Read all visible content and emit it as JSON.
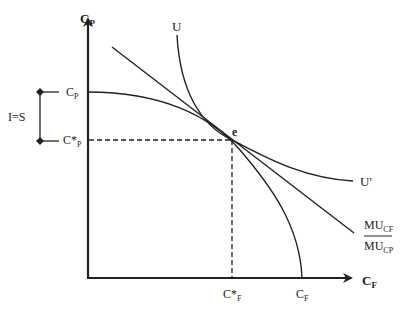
{
  "diagram": {
    "type": "intertemporal-consumption-ppf",
    "axes": {
      "y_label": {
        "main": "C",
        "sub": "P"
      },
      "x_label": {
        "main": "C",
        "sub": "F"
      }
    },
    "y_ticks": {
      "max": {
        "main": "C",
        "sub": "P"
      },
      "optimal": {
        "main": "C*",
        "sub": "P"
      }
    },
    "x_ticks": {
      "optimal": {
        "main": "C*",
        "sub": "F"
      },
      "max": {
        "main": "C",
        "sub": "F"
      }
    },
    "bracket_label": "I=S",
    "point_label": "e",
    "curves": {
      "indifference_top_label": "U",
      "indifference_end_label": "U'",
      "tangent_label": {
        "numerator_main": "MU",
        "numerator_sub": "CF",
        "denominator_main": "MU",
        "denominator_sub": "CP"
      }
    },
    "colors": {
      "line": "#222222",
      "background": "#ffffff"
    }
  }
}
